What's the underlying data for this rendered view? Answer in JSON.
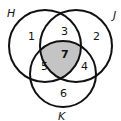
{
  "diagram": {
    "type": "venn-3",
    "sets": [
      {
        "name": "H",
        "cx": 45,
        "cy": 46,
        "r": 36
      },
      {
        "name": "J",
        "cx": 76,
        "cy": 46,
        "r": 36
      },
      {
        "name": "K",
        "cx": 63,
        "cy": 74,
        "r": 33
      }
    ],
    "set_labels": {
      "H": "H",
      "J": "J",
      "K": "K"
    },
    "regions": {
      "H_only": "1",
      "J_only": "2",
      "H_and_J_only": "3",
      "J_and_K_only": "4",
      "H_and_K_only": "5",
      "K_only": "6",
      "H_and_J_and_K": "7"
    },
    "shaded_region": "H_and_J_and_K",
    "colors": {
      "stroke": "#111111",
      "shade": "#c4c4c4",
      "background": "#ffffff"
    }
  }
}
